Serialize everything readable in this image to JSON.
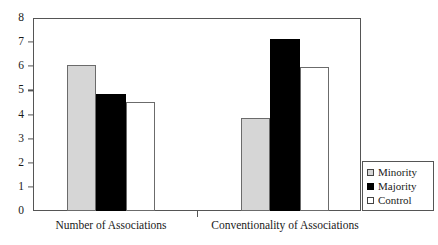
{
  "chart_data": {
    "type": "bar",
    "title": "",
    "subtitle": "",
    "xlabel": "",
    "ylabel": "",
    "ylim": [
      0,
      8
    ],
    "yticks": [
      0,
      1,
      2,
      3,
      4,
      5,
      6,
      7,
      8
    ],
    "ytick_labels": [
      "0",
      "1",
      "2",
      "3",
      "4",
      "5",
      "6",
      "7",
      "8"
    ],
    "grid": false,
    "legend_position": "right-bottom-outside",
    "categories": [
      "Number of Associations",
      "Conventionality of Associations"
    ],
    "series": [
      {
        "name": "Minority",
        "color": "#d6d6d6",
        "values": [
          6.05,
          3.87
        ]
      },
      {
        "name": "Majority",
        "color": "#000000",
        "values": [
          4.87,
          7.12
        ]
      },
      {
        "name": "Control",
        "color": "#ffffff",
        "values": [
          4.52,
          5.98
        ]
      }
    ]
  },
  "legend": {
    "items": [
      {
        "label": "Minority",
        "swatch": "square-filled-gray"
      },
      {
        "label": "Majority",
        "swatch": "square-filled-black"
      },
      {
        "label": "Control",
        "swatch": "square-outline-white"
      }
    ]
  },
  "axis": {
    "y_tick_labels": [
      "8",
      "7",
      "6",
      "5",
      "4",
      "3",
      "2",
      "1",
      "0"
    ]
  }
}
